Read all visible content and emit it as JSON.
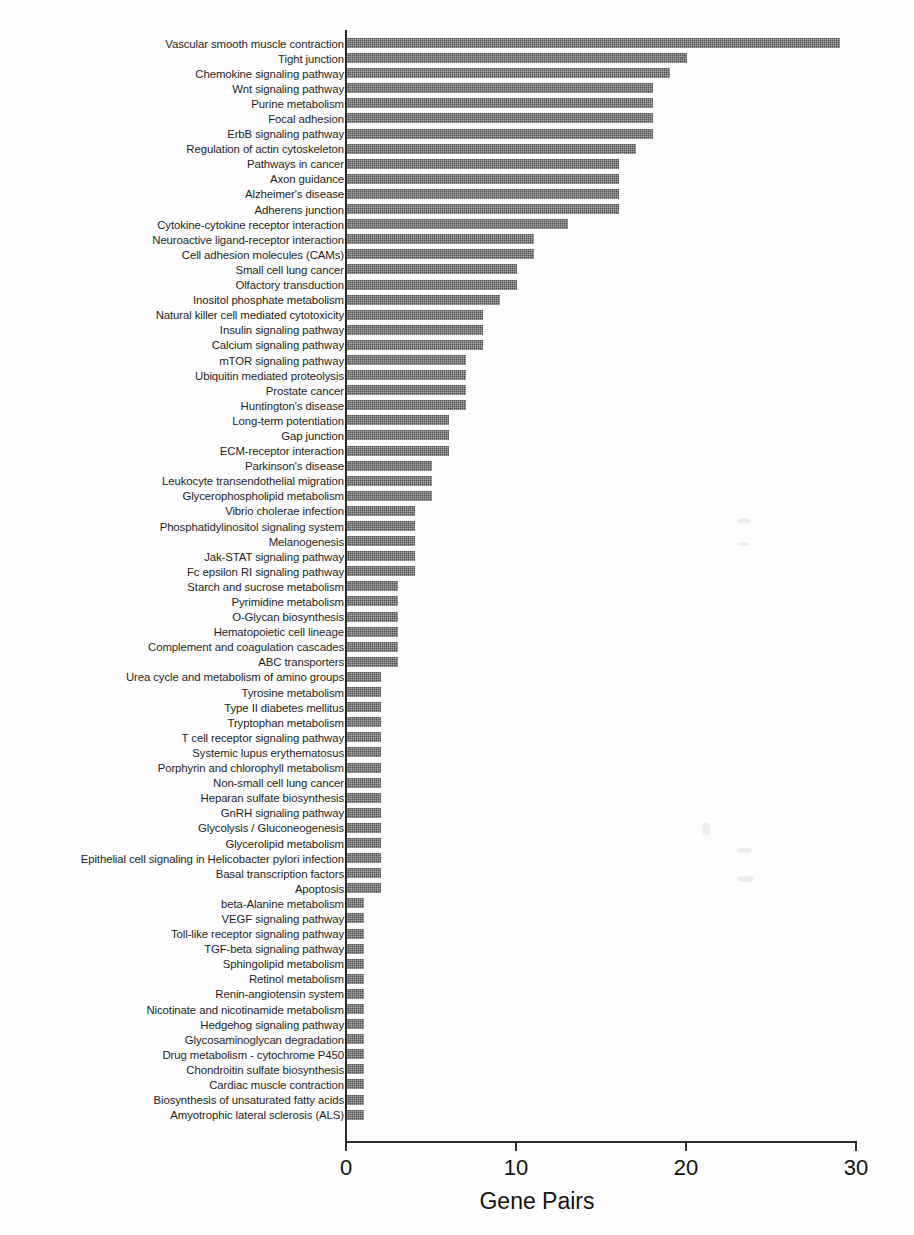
{
  "chart_data": {
    "type": "bar",
    "orientation": "horizontal",
    "title": "",
    "xlabel": "Gene Pairs",
    "ylabel": "",
    "xlim": [
      0,
      30
    ],
    "xticks": [
      0,
      10,
      20,
      30
    ],
    "xtick_labels": [
      "0",
      "10",
      "20",
      "30"
    ],
    "grid": false,
    "legend": null,
    "bar_color": "#4d4d4d",
    "categories": [
      "Vascular smooth muscle contraction",
      "Tight junction",
      "Chemokine signaling pathway",
      "Wnt signaling pathway",
      "Purine metabolism",
      "Focal adhesion",
      "ErbB signaling pathway",
      "Regulation of actin cytoskeleton",
      "Pathways in cancer",
      "Axon guidance",
      "Alzheimer's disease",
      "Adherens junction",
      "Cytokine-cytokine receptor interaction",
      "Neuroactive ligand-receptor interaction",
      "Cell adhesion molecules (CAMs)",
      "Small cell lung cancer",
      "Olfactory transduction",
      "Inositol phosphate metabolism",
      "Natural killer cell mediated cytotoxicity",
      "Insulin signaling pathway",
      "Calcium signaling pathway",
      "mTOR signaling pathway",
      "Ubiquitin mediated proteolysis",
      "Prostate cancer",
      "Huntington's disease",
      "Long-term potentiation",
      "Gap junction",
      "ECM-receptor interaction",
      "Parkinson's disease",
      "Leukocyte transendothelial migration",
      "Glycerophospholipid metabolism",
      "Vibrio cholerae infection",
      "Phosphatidylinositol signaling system",
      "Melanogenesis",
      "Jak-STAT signaling pathway",
      "Fc epsilon RI signaling pathway",
      "Starch and sucrose metabolism",
      "Pyrimidine metabolism",
      "O-Glycan biosynthesis",
      "Hematopoietic cell lineage",
      "Complement and coagulation cascades",
      "ABC transporters",
      "Urea cycle and metabolism of amino groups",
      "Tyrosine metabolism",
      "Type II diabetes mellitus",
      "Tryptophan metabolism",
      "T cell receptor signaling pathway",
      "Systemic lupus erythematosus",
      "Porphyrin and chlorophyll metabolism",
      "Non-small cell lung cancer",
      "Heparan sulfate biosynthesis",
      "GnRH signaling pathway",
      "Glycolysis / Gluconeogenesis",
      "Glycerolipid metabolism",
      "Epithelial cell signaling in Helicobacter pylori infection",
      "Basal transcription factors",
      "Apoptosis",
      "beta-Alanine metabolism",
      "VEGF signaling pathway",
      "Toll-like receptor signaling pathway",
      "TGF-beta signaling pathway",
      "Sphingolipid metabolism",
      "Retinol metabolism",
      "Renin-angiotensin system",
      "Nicotinate and nicotinamide metabolism",
      "Hedgehog signaling pathway",
      "Glycosaminoglycan degradation",
      "Drug metabolism - cytochrome P450",
      "Chondroitin sulfate biosynthesis",
      "Cardiac muscle contraction",
      "Biosynthesis of unsaturated fatty acids",
      "Amyotrophic lateral sclerosis (ALS)"
    ],
    "values": [
      29,
      20,
      19,
      18,
      18,
      18,
      18,
      17,
      16,
      16,
      16,
      16,
      13,
      11,
      11,
      10,
      10,
      9,
      8,
      8,
      8,
      7,
      7,
      7,
      7,
      6,
      6,
      6,
      5,
      5,
      5,
      4,
      4,
      4,
      4,
      4,
      3,
      3,
      3,
      3,
      3,
      3,
      2,
      2,
      2,
      2,
      2,
      2,
      2,
      2,
      2,
      2,
      2,
      2,
      2,
      2,
      2,
      1,
      1,
      1,
      1,
      1,
      1,
      1,
      1,
      1,
      1,
      1,
      1,
      1,
      1,
      1
    ]
  }
}
